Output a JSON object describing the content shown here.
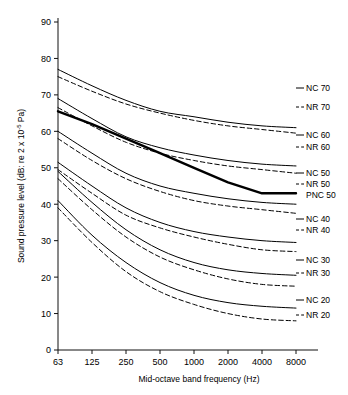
{
  "chart_data": {
    "type": "line",
    "title": "",
    "xlabel": "Mid-octave band frequency (Hz)",
    "ylabel": "Sound pressure level (dB: re 2 x 10⁻⁵ Pa)",
    "ylabel_parts": {
      "prefix": "Sound pressure level (dB: re 2 x 10",
      "exponent": "-5",
      "suffix": " Pa)"
    },
    "x": [
      63,
      125,
      250,
      500,
      1000,
      2000,
      4000,
      8000
    ],
    "xtick_labels": [
      "63",
      "125",
      "250",
      "500",
      "1000",
      "2000",
      "4000",
      "8000"
    ],
    "ytick_labels": [
      "0",
      "10",
      "20",
      "30",
      "40",
      "50",
      "60",
      "70",
      "80",
      "90"
    ],
    "yticks": [
      0,
      10,
      20,
      30,
      40,
      50,
      60,
      70,
      80,
      90
    ],
    "ylim": [
      0,
      90
    ],
    "xscale": "log-octave",
    "grid": false,
    "legend_position": "right-inline",
    "series": [
      {
        "name": "NC 70",
        "label": "NC 70",
        "style": "solid",
        "color": "#000000",
        "width": 1.0,
        "values": [
          77.0,
          72.5,
          68.5,
          65.5,
          64.0,
          62.5,
          61.5,
          61.0
        ]
      },
      {
        "name": "NR 70",
        "label": "NR 70",
        "style": "dashed",
        "color": "#000000",
        "width": 1.0,
        "values": [
          75.0,
          71.0,
          67.5,
          65.0,
          63.0,
          61.5,
          60.5,
          59.5
        ]
      },
      {
        "name": "NC 60",
        "label": "NC 60",
        "style": "solid",
        "color": "#000000",
        "width": 1.0,
        "values": [
          69.0,
          63.5,
          58.5,
          55.5,
          53.5,
          52.0,
          51.0,
          50.5
        ]
      },
      {
        "name": "NR 60",
        "label": "NR 60",
        "style": "dashed",
        "color": "#000000",
        "width": 1.0,
        "values": [
          66.5,
          61.5,
          57.0,
          54.0,
          52.0,
          50.5,
          49.5,
          48.5
        ]
      },
      {
        "name": "NC 50",
        "label": "NC 50",
        "style": "solid",
        "color": "#000000",
        "width": 1.0,
        "values": [
          60.0,
          54.0,
          48.5,
          45.0,
          43.0,
          41.5,
          40.5,
          40.0
        ]
      },
      {
        "name": "NR 50",
        "label": "NR 50",
        "style": "dashed",
        "color": "#000000",
        "width": 1.0,
        "values": [
          58.0,
          52.0,
          47.0,
          43.5,
          41.0,
          39.5,
          38.5,
          37.5
        ]
      },
      {
        "name": "PNC 50",
        "label": "PNC 50",
        "style": "bold-solid",
        "color": "#000000",
        "width": 2.4,
        "values": [
          65.5,
          62.0,
          58.0,
          54.0,
          50.0,
          46.0,
          43.0,
          43.0
        ]
      },
      {
        "name": "NC 40",
        "label": "NC 40",
        "style": "solid",
        "color": "#000000",
        "width": 1.0,
        "values": [
          51.5,
          45.0,
          39.0,
          35.0,
          32.5,
          31.0,
          30.0,
          29.5
        ]
      },
      {
        "name": "NR 40",
        "label": "NR 40",
        "style": "dashed",
        "color": "#000000",
        "width": 1.0,
        "values": [
          49.5,
          43.0,
          37.0,
          33.5,
          31.0,
          29.0,
          27.5,
          27.0
        ]
      },
      {
        "name": "NC 30",
        "label": "NC 30",
        "style": "solid",
        "color": "#000000",
        "width": 1.0,
        "values": [
          49.0,
          40.5,
          33.0,
          27.5,
          24.0,
          22.0,
          21.0,
          20.5
        ]
      },
      {
        "name": "NR 30",
        "label": "NR 30",
        "style": "dashed",
        "color": "#000000",
        "width": 1.0,
        "values": [
          47.0,
          38.5,
          31.0,
          25.5,
          22.0,
          19.5,
          18.0,
          17.5
        ]
      },
      {
        "name": "NC 20",
        "label": "NC 20",
        "style": "solid",
        "color": "#000000",
        "width": 1.0,
        "values": [
          41.0,
          31.5,
          24.0,
          18.5,
          15.0,
          13.0,
          12.0,
          11.5
        ]
      },
      {
        "name": "NR 20",
        "label": "NR 20",
        "style": "dashed",
        "color": "#000000",
        "width": 1.0,
        "values": [
          39.0,
          29.5,
          21.5,
          16.0,
          12.5,
          10.0,
          8.5,
          8.0
        ]
      }
    ],
    "curve_labels": [
      {
        "text": "NC 70",
        "style": "solid",
        "y": 91.0
      },
      {
        "text": "NR 70",
        "style": "dashed",
        "y": 110.0
      },
      {
        "text": "NC 60",
        "style": "solid",
        "y": 138.0
      },
      {
        "text": "NR 60",
        "style": "dashed",
        "y": 150.0
      },
      {
        "text": "NC 50",
        "style": "solid",
        "y": 176.0
      },
      {
        "text": "NR 50",
        "style": "dashed",
        "y": 187.0
      },
      {
        "text": "PNC 50",
        "style": "bold-solid",
        "y": 198.0
      },
      {
        "text": "NC 40",
        "style": "solid",
        "y": 222.0
      },
      {
        "text": "NR 40",
        "style": "dashed",
        "y": 233.0
      },
      {
        "text": "NC 30",
        "style": "solid",
        "y": 263.0
      },
      {
        "text": "NR 30",
        "style": "dashed",
        "y": 276.0
      },
      {
        "text": "NC 20",
        "style": "solid",
        "y": 303.0
      },
      {
        "text": "NR 20",
        "style": "dashed",
        "y": 318.0
      }
    ]
  }
}
